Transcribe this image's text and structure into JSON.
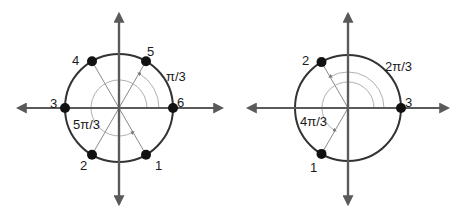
{
  "colors": {
    "axis": "#5a5a5a",
    "circle": "#333333",
    "radius_line": "#8a8a8a",
    "arc": "#b0b0b0",
    "arc_arrow": "#7a7a7a",
    "point": "#111111",
    "text": "#1a1a1a"
  },
  "diagrams": [
    {
      "name": "left-unit-circle",
      "center": [
        119,
        108
      ],
      "radius": 54,
      "step_label": "π/3",
      "sum_label": "5π/3",
      "points": [
        {
          "label": "1",
          "angle_deg": 300
        },
        {
          "label": "2",
          "angle_deg": 240
        },
        {
          "label": "3",
          "angle_deg": 180
        },
        {
          "label": "4",
          "angle_deg": 120
        },
        {
          "label": "5",
          "angle_deg": 60
        },
        {
          "label": "6",
          "angle_deg": 0
        }
      ]
    },
    {
      "name": "right-unit-circle",
      "center": [
        348,
        108
      ],
      "radius": 53,
      "step_label": "2π/3",
      "sum_label": "4π/3",
      "points": [
        {
          "label": "1",
          "angle_deg": 240
        },
        {
          "label": "2",
          "angle_deg": 120
        },
        {
          "label": "3",
          "angle_deg": 0
        }
      ]
    }
  ]
}
